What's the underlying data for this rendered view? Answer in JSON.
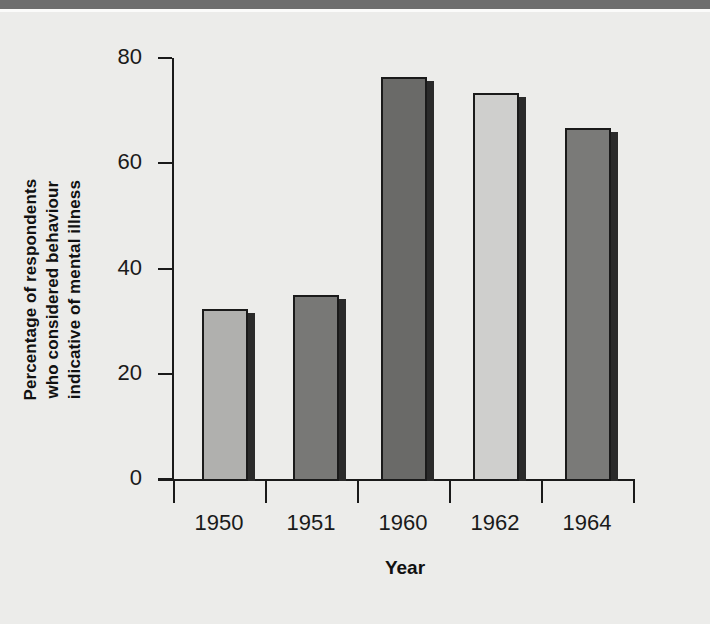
{
  "figure": {
    "background_color": "#ececea",
    "top_band_color": "#6e6e6e",
    "axis_color": "#1a1a1a"
  },
  "chart_data": {
    "type": "bar",
    "title": "",
    "xlabel": "Year",
    "ylabel": "Percentage of respondents who considered behaviour indicative of mental illness",
    "ylabel_lines": [
      "Percentage of respondents",
      "who considered behaviour",
      "indicative of mental illness"
    ],
    "categories": [
      "1950",
      "1951",
      "1960",
      "1962",
      "1964"
    ],
    "values": [
      32.3,
      35,
      76.4,
      73.4,
      66.7
    ],
    "bar_colors": [
      "#b0b0ae",
      "#787876",
      "#6a6a68",
      "#cfcfcd",
      "#7a7a78"
    ],
    "ylim": [
      0,
      80
    ],
    "yticks": [
      "0",
      "20",
      "40",
      "60",
      "80"
    ],
    "ytick_values": [
      0,
      20,
      40,
      60,
      80
    ],
    "grid": false,
    "legend": "none"
  }
}
